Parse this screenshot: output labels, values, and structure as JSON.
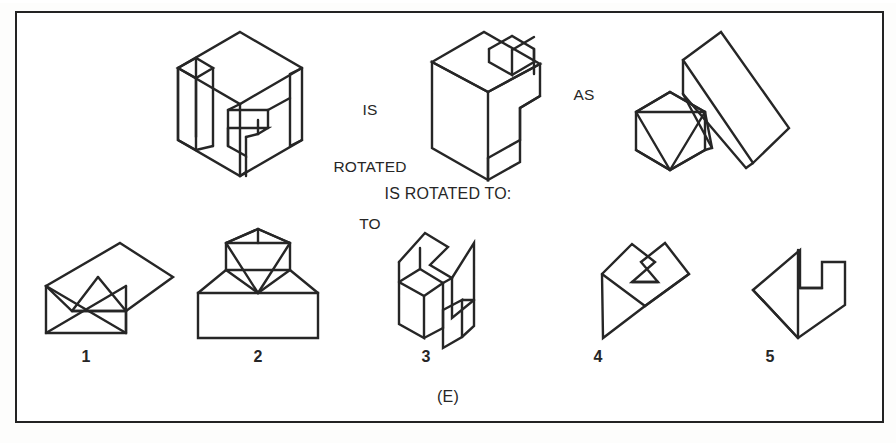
{
  "page": {
    "kind": "spatial-reasoning-test-item",
    "plate_label": "(E)",
    "frame_color": "#232323",
    "ink_color": "#262626",
    "background_color": "#ffffff"
  },
  "stem": {
    "connector_1": "IS\nROTATED\nTO",
    "connector_1_lines": [
      "IS",
      "ROTATED",
      "TO"
    ],
    "connector_2": "AS",
    "prompt": "IS ROTATED TO:"
  },
  "stem_figures": [
    {
      "position": 1,
      "name": "notched-cube-figure",
      "description": "isometric cube with rectangular slot cut through and protruding slab"
    },
    {
      "position": 2,
      "name": "l-block-figure",
      "description": "isometric L-shaped block with notch in top face"
    },
    {
      "position": 3,
      "name": "icosahedron-wedge-figure",
      "description": "triangulated polyhedron beside a long angled wedge bar"
    }
  ],
  "options": [
    {
      "number": "1",
      "name": "option-1-figure",
      "description": "flat kite-like polygon with crossed triangles at lower left"
    },
    {
      "number": "2",
      "name": "option-2-figure",
      "description": "triangulated faceted dome seated on a rectangular base block"
    },
    {
      "number": "3",
      "name": "option-3-figure",
      "description": "isometric zigzag notched block, upright"
    },
    {
      "number": "4",
      "name": "option-4-figure",
      "description": "flat angular arrow-like polygon with notch at right"
    },
    {
      "number": "5",
      "name": "option-5-figure",
      "description": "flat arrow-head polygon with stepped notch at upper right"
    }
  ]
}
